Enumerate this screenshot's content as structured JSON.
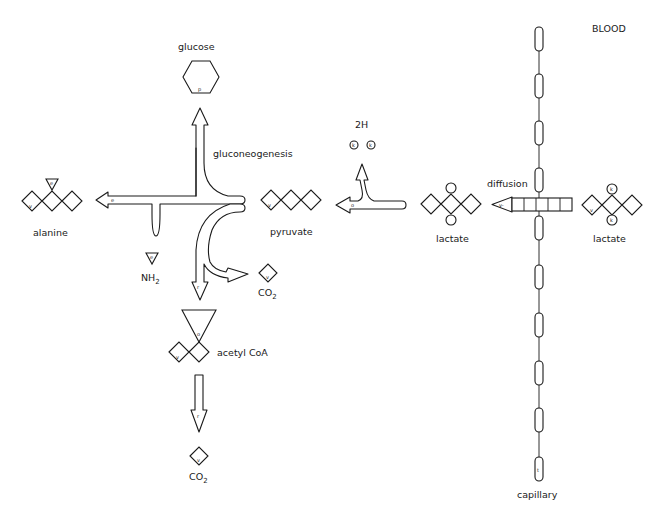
{
  "labels": {
    "blood": "BLOOD",
    "glucose": "glucose",
    "gluconeogenesis": "gluconeogenesis",
    "alanine": "alanine",
    "pyruvate": "pyruvate",
    "nh2_main": "NH",
    "nh2_sub": "2",
    "co2_mid_main": "CO",
    "co2_mid_sub": "2",
    "acetyl_coa": "acetyl  CoA",
    "co2_bottom_main": "CO",
    "co2_bottom_sub": "2",
    "two_h": "2H",
    "lactate_tissue": "lactate",
    "diffusion": "diffusion",
    "lactate_blood": "lactate",
    "capillary": "capillary"
  },
  "glyphs": {
    "glucose_p": "p",
    "alanine_e": "e",
    "alanine_v": "v",
    "alanine_arrow_e": "e",
    "nh2_e": "e",
    "pyruvate_v": "v",
    "co2_mid_v": "v",
    "arrow_acetyl_r": "r",
    "acetyl_o": "o",
    "acetyl_v": "v",
    "arrow_co2_r": "r",
    "co2_bottom_v": "v",
    "h_k1": "k",
    "h_k2": "k",
    "lactate_arrow_o": "o",
    "diffusion_v": "v-",
    "blood_lactate_k_top": "k",
    "blood_lactate_k_bottom": "k",
    "blood_lactate_v": "v",
    "capillary_t": "t"
  }
}
